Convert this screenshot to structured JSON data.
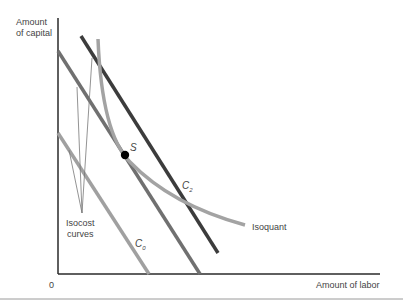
{
  "diagram": {
    "y_axis_label_line1": "Amount",
    "y_axis_label_line2": "of capital",
    "x_axis_label": "Amount of labor",
    "origin_label": "0",
    "point_label": "S",
    "c2_label": "C",
    "c2_sub": "2",
    "c0_label": "C",
    "c0_sub": "0",
    "isoquant_label": "Isoquant",
    "isocost_label_line1": "Isocost",
    "isocost_label_line2": "curves"
  },
  "colors": {
    "axis": "#2a2a2a",
    "c2": "#3c3c3c",
    "c1": "#707070",
    "c0": "#a0a0a0",
    "isoquant": "#a3a3a3",
    "point": "#000000",
    "divider": "#9a9a9a"
  }
}
